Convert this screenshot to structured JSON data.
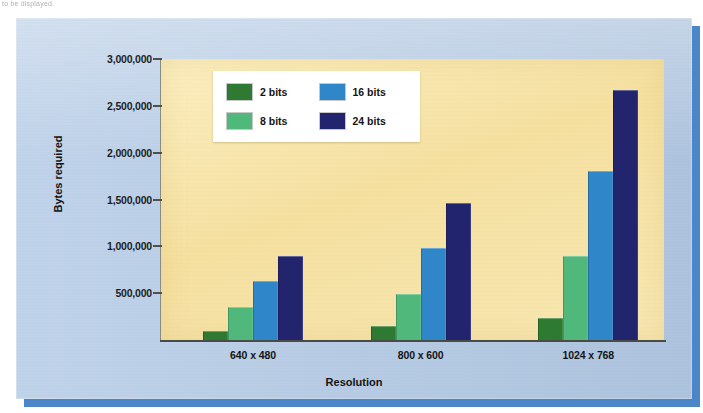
{
  "page": {
    "top_fragment": "to be displayed."
  },
  "figure": {
    "card_color": "#b4cbe6",
    "shadow_color": "#4a86c8",
    "plot_background": "#f6e3a8"
  },
  "chart_data": {
    "type": "bar",
    "title": "",
    "xlabel": "Resolution",
    "ylabel": "Bytes required",
    "categories": [
      "640 x 480",
      "800 x 600",
      "1024 x 768"
    ],
    "series": [
      {
        "name": "2 bits",
        "color": "#2e7a32",
        "values": [
          97000,
          150000,
          230000
        ]
      },
      {
        "name": "8 bits",
        "color": "#4fb87a",
        "values": [
          350000,
          495000,
          895000
        ]
      },
      {
        "name": "16 bits",
        "color": "#2f86c8",
        "values": [
          625000,
          980000,
          1800000
        ]
      },
      {
        "name": "24 bits",
        "color": "#23246e",
        "values": [
          900000,
          1460000,
          2670000
        ]
      }
    ],
    "ylim": [
      0,
      3000000
    ],
    "ytick_values": [
      500000,
      1000000,
      1500000,
      2000000,
      2500000,
      3000000
    ],
    "ytick_labels": [
      "500,000",
      "1,000,000",
      "1,500,000",
      "2,000,000",
      "2,500,000",
      "3,000,000"
    ],
    "grid": false,
    "legend_position": "upper-left-inside"
  }
}
